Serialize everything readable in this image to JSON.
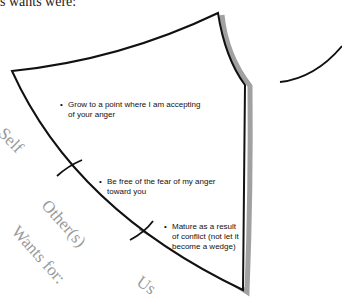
{
  "header": {
    "partial_text": "s wants were:"
  },
  "bullets": [
    {
      "text_line1": "Grow to a point where I am accepting",
      "text_line2": "of your anger"
    },
    {
      "text_line1": "Be free of the fear of my anger",
      "text_line2": "toward you"
    },
    {
      "text_line1": "Mature as a result",
      "text_line2": "of conflict (not let it",
      "text_line3": "become a wedge)"
    }
  ],
  "labels": {
    "self": "Self",
    "others": "Other(s)",
    "wants_for": "Wants for:",
    "us": "Us"
  },
  "bullet_glyph": "•",
  "colors": {
    "stroke": "#111111",
    "shadow": "#8a8a8a",
    "label": "#9a9a9a"
  }
}
